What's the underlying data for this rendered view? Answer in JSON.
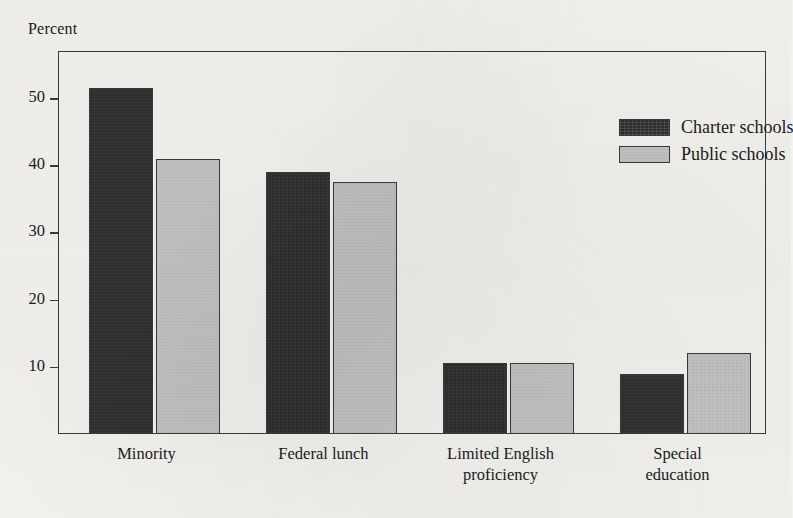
{
  "chart_data": {
    "type": "bar",
    "title": "",
    "xlabel": "",
    "ylabel": "Percent",
    "ylim": [
      0,
      57
    ],
    "yticks": [
      10,
      20,
      30,
      40,
      50
    ],
    "ytick_labels": [
      "10",
      "20",
      "30",
      "40",
      "50"
    ],
    "grid": false,
    "legend_position": "top-right inside plot frame",
    "categories": [
      "Minority",
      "Federal lunch",
      "Limited English\nproficiency",
      "Special\neducation"
    ],
    "series": [
      {
        "name": "Charter schools",
        "color": "#2e2e2e",
        "values": [
          51.5,
          39.0,
          10.5,
          9.0
        ]
      },
      {
        "name": "Public schools",
        "color": "#c4c4c4",
        "values": [
          41.0,
          37.5,
          10.5,
          12.0
        ]
      }
    ]
  },
  "legend": {
    "items": [
      {
        "label": "Charter schools",
        "swatch": "charter"
      },
      {
        "label": "Public schools",
        "swatch": "public"
      }
    ]
  },
  "axis": {
    "y_title": "Percent"
  },
  "colors": {
    "charter": "#2e2e2e",
    "public": "#c4c4c4",
    "frame": "#3a3a3a",
    "paper": "#f3f2ef",
    "ink": "#1b1b1b"
  }
}
